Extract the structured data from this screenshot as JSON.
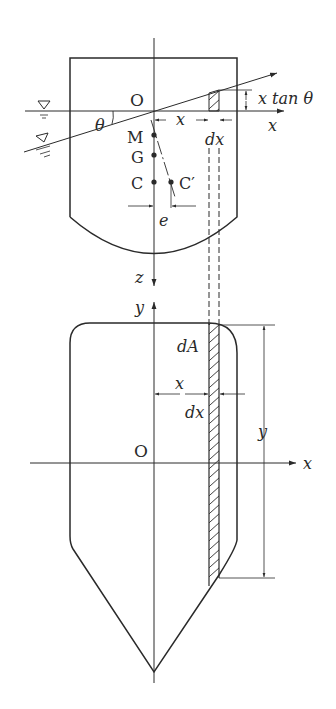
{
  "figure": {
    "colors": {
      "line": "#2a2a2a",
      "background": "#ffffff"
    }
  },
  "top_view": {
    "labels": {
      "origin": "O",
      "angle": "θ",
      "metacenter": "M",
      "gravity_center": "G",
      "buoyancy_center": "C",
      "buoyancy_center_shifted": "C′",
      "eccentricity": "e",
      "x_distance": "x",
      "strip_width": "dx",
      "x_axis": "x",
      "z_axis": "z",
      "height_expr": "x tan θ"
    },
    "water_symbols": [
      "free-surface-level",
      "heeled-surface-level"
    ]
  },
  "bottom_view": {
    "labels": {
      "origin": "O",
      "x_axis": "x",
      "y_axis": "y",
      "area_element": "dA",
      "x_distance": "x",
      "strip_width": "dx",
      "strip_length": "y"
    }
  }
}
